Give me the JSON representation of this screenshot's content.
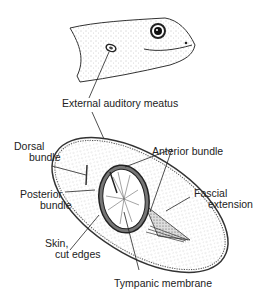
{
  "figure": {
    "colors": {
      "ink": "#222222",
      "stipple": "#9a9a9a",
      "background": "#ffffff"
    }
  },
  "labels": {
    "external_auditory_meatus": "External auditory meatus",
    "dorsal_bundle_1": "Dorsal",
    "dorsal_bundle_2": "bundle",
    "anterior_bundle": "Anterior  bundle",
    "posterior_bundle_1": "Posterior",
    "posterior_bundle_2": "bundle",
    "fascial_extension_1": "Fascial",
    "fascial_extension_2": "extension",
    "skin_cut_edges_1": "Skin,",
    "skin_cut_edges_2": "cut edges",
    "tympanic_membrane": "Tympanic membrane"
  }
}
